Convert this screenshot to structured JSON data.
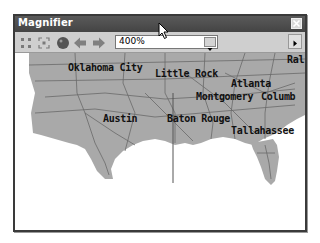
{
  "window": {
    "title": "Magnifier",
    "close_label": "×"
  },
  "toolbar": {
    "icons": [
      "collapse-icon",
      "expand-icon",
      "record-icon",
      "back-arrow-icon",
      "forward-arrow-icon"
    ],
    "zoom_value": "400%",
    "dropdown_icon": "chevron-down-icon",
    "more_icon": "chevron-right-icon"
  },
  "map": {
    "labels": [
      {
        "text": "Oklahoma City",
        "x": 55,
        "y": 16
      },
      {
        "text": "Little Rock",
        "x": 142,
        "y": 22
      },
      {
        "text": "Ral",
        "x": 274,
        "y": 12
      },
      {
        "text": "Atlanta",
        "x": 218,
        "y": 32
      },
      {
        "text": "Montgomery",
        "x": 183,
        "y": 45
      },
      {
        "text": "Columb",
        "x": 248,
        "y": 45
      },
      {
        "text": "Austin",
        "x": 90,
        "y": 67
      },
      {
        "text": "Baton Rouge",
        "x": 154,
        "y": 67
      },
      {
        "text": "Tallahassee",
        "x": 218,
        "y": 78
      }
    ],
    "colors": {
      "land": "#a9a9a9",
      "roads": "#6a6a6a",
      "water": "#ffffff"
    }
  }
}
